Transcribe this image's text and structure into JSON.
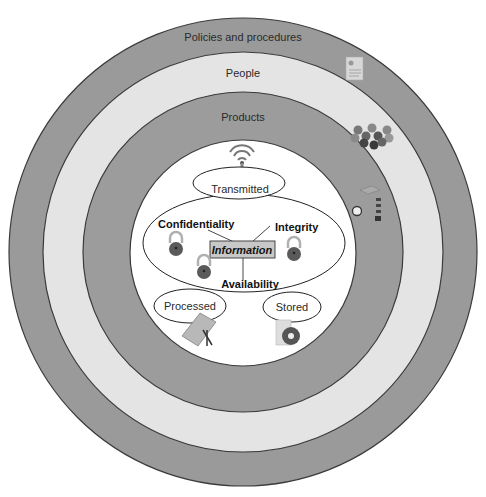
{
  "diagram": {
    "rings": [
      {
        "label": "Policies and procedures",
        "color": "#9a9a9a"
      },
      {
        "label": "People",
        "color": "#e4e4e4"
      },
      {
        "label": "Products",
        "color": "#9c9c9c"
      }
    ],
    "core": {
      "color": "#ffffff",
      "center_label": "Information",
      "center_box_color": "#c8c8c8",
      "properties": [
        "Confidentiality",
        "Integrity",
        "Availability"
      ],
      "states": [
        "Transmitted",
        "Processed",
        "Stored"
      ]
    },
    "icons": {
      "policies": "document-icon",
      "people": "people-group-icon",
      "products": "server-icon",
      "transmitted": "antenna-icon",
      "processed": "notebook-icon",
      "stored": "disc-icon",
      "lock": "padlock-icon"
    },
    "colors": {
      "outline": "#3a3a3a",
      "lock_body": "#5a5a5a",
      "lock_shackle": "#b0b0b0"
    }
  }
}
